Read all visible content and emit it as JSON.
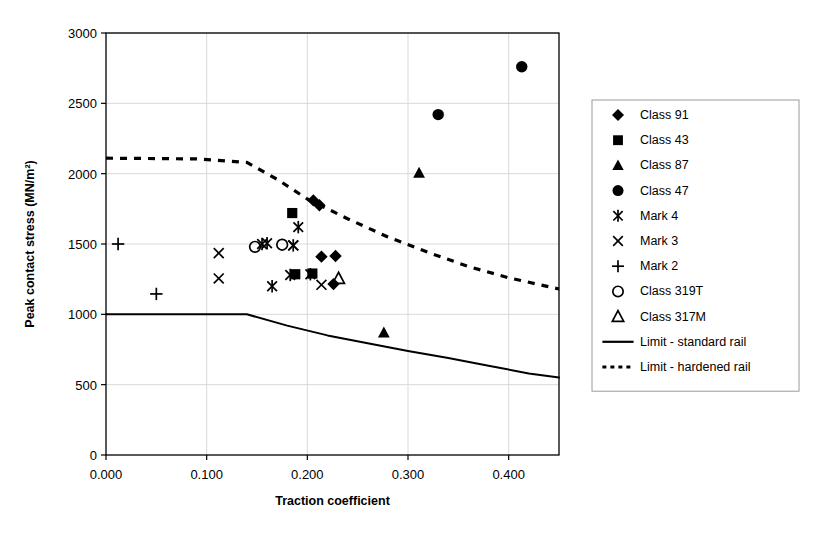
{
  "chart_data": {
    "type": "scatter",
    "title": "",
    "xlabel": "Traction coefficient",
    "ylabel": "Peak contact stress (MN/m²)",
    "xlim": [
      0.0,
      0.45
    ],
    "ylim": [
      0,
      3000
    ],
    "xticks": [
      "0.000",
      "0.100",
      "0.200",
      "0.300",
      "0.400"
    ],
    "xtick_values": [
      0.0,
      0.1,
      0.2,
      0.3,
      0.4
    ],
    "yticks": [
      "0",
      "500",
      "1000",
      "1500",
      "2000",
      "2500",
      "3000"
    ],
    "ytick_values": [
      0,
      500,
      1000,
      1500,
      2000,
      2500,
      3000
    ],
    "grid": true,
    "legend_position": "right",
    "series": [
      {
        "name": "Class 91",
        "marker": "diamond-filled",
        "points": [
          {
            "x": 0.206,
            "y": 1810
          },
          {
            "x": 0.212,
            "y": 1775
          },
          {
            "x": 0.214,
            "y": 1410
          },
          {
            "x": 0.228,
            "y": 1415
          },
          {
            "x": 0.226,
            "y": 1215
          }
        ]
      },
      {
        "name": "Class 43",
        "marker": "square-filled",
        "points": [
          {
            "x": 0.185,
            "y": 1720
          },
          {
            "x": 0.188,
            "y": 1285
          },
          {
            "x": 0.205,
            "y": 1290
          }
        ]
      },
      {
        "name": "Class 87",
        "marker": "triangle-filled",
        "points": [
          {
            "x": 0.311,
            "y": 2005
          },
          {
            "x": 0.276,
            "y": 870
          }
        ]
      },
      {
        "name": "Class 47",
        "marker": "circle-filled",
        "points": [
          {
            "x": 0.413,
            "y": 2760
          },
          {
            "x": 0.33,
            "y": 2420
          }
        ]
      },
      {
        "name": "Mark 4",
        "marker": "asterisk",
        "points": [
          {
            "x": 0.191,
            "y": 1620
          },
          {
            "x": 0.155,
            "y": 1500
          },
          {
            "x": 0.16,
            "y": 1505
          },
          {
            "x": 0.186,
            "y": 1490
          },
          {
            "x": 0.165,
            "y": 1200
          },
          {
            "x": 0.183,
            "y": 1280
          },
          {
            "x": 0.203,
            "y": 1285
          }
        ]
      },
      {
        "name": "Mark 3",
        "marker": "cross-x",
        "points": [
          {
            "x": 0.112,
            "y": 1435
          },
          {
            "x": 0.112,
            "y": 1255
          },
          {
            "x": 0.186,
            "y": 1490
          },
          {
            "x": 0.214,
            "y": 1210
          }
        ]
      },
      {
        "name": "Mark 2",
        "marker": "plus",
        "points": [
          {
            "x": 0.012,
            "y": 1500
          },
          {
            "x": 0.05,
            "y": 1145
          }
        ]
      },
      {
        "name": "Class 319T",
        "marker": "circle-open",
        "points": [
          {
            "x": 0.148,
            "y": 1480
          },
          {
            "x": 0.175,
            "y": 1495
          }
        ]
      },
      {
        "name": "Class 317M",
        "marker": "triangle-open",
        "points": [
          {
            "x": 0.231,
            "y": 1255
          }
        ]
      }
    ],
    "limit_lines": [
      {
        "name": "Limit - standard rail",
        "style": "solid",
        "points": [
          {
            "x": 0.0,
            "y": 1000
          },
          {
            "x": 0.14,
            "y": 1000
          },
          {
            "x": 0.18,
            "y": 920
          },
          {
            "x": 0.22,
            "y": 850
          },
          {
            "x": 0.26,
            "y": 795
          },
          {
            "x": 0.3,
            "y": 740
          },
          {
            "x": 0.34,
            "y": 690
          },
          {
            "x": 0.38,
            "y": 635
          },
          {
            "x": 0.42,
            "y": 580
          },
          {
            "x": 0.45,
            "y": 550
          }
        ]
      },
      {
        "name": "Limit - hardened rail",
        "style": "dashed",
        "points": [
          {
            "x": 0.0,
            "y": 2110
          },
          {
            "x": 0.09,
            "y": 2105
          },
          {
            "x": 0.14,
            "y": 2080
          },
          {
            "x": 0.17,
            "y": 1960
          },
          {
            "x": 0.2,
            "y": 1820
          },
          {
            "x": 0.24,
            "y": 1680
          },
          {
            "x": 0.28,
            "y": 1550
          },
          {
            "x": 0.32,
            "y": 1440
          },
          {
            "x": 0.36,
            "y": 1340
          },
          {
            "x": 0.4,
            "y": 1260
          },
          {
            "x": 0.45,
            "y": 1180
          }
        ]
      }
    ]
  },
  "legend": {
    "items": [
      {
        "label": "Class 91",
        "marker": "diamond-filled"
      },
      {
        "label": "Class 43",
        "marker": "square-filled"
      },
      {
        "label": "Class 87",
        "marker": "triangle-filled"
      },
      {
        "label": "Class 47",
        "marker": "circle-filled"
      },
      {
        "label": "Mark 4",
        "marker": "asterisk"
      },
      {
        "label": "Mark 3",
        "marker": "cross-x"
      },
      {
        "label": "Mark 2",
        "marker": "plus"
      },
      {
        "label": "Class 319T",
        "marker": "circle-open"
      },
      {
        "label": "Class 317M",
        "marker": "triangle-open"
      },
      {
        "label": "Limit - standard rail",
        "marker": "line-solid"
      },
      {
        "label": "Limit - hardened rail",
        "marker": "line-dashed"
      }
    ]
  },
  "colors": {
    "ink": "#000000",
    "grid": "#d9d9d9",
    "axis": "#000000",
    "background": "#ffffff"
  }
}
